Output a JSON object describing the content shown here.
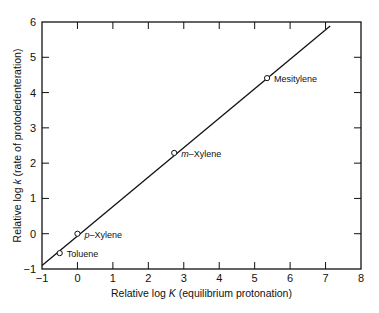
{
  "chart_data": {
    "type": "scatter",
    "title": "",
    "xlabel": "Relative log K (equilibrium protonation)",
    "xlabel_parts": [
      "Relative log ",
      "K",
      " (equilibrium protonation)"
    ],
    "ylabel": "Relative log k (rate of protodedenteration)",
    "ylabel_parts": [
      "Relative log ",
      "k",
      " (rate of protodedenteration)"
    ],
    "xlim": [
      -1,
      8
    ],
    "ylim": [
      -1,
      6
    ],
    "xticks": [
      -1,
      0,
      1,
      2,
      3,
      4,
      5,
      6,
      7,
      8
    ],
    "yticks": [
      -1,
      0,
      1,
      2,
      3,
      4,
      5,
      6
    ],
    "grid": false,
    "legend": null,
    "points": [
      {
        "label": "Toluene",
        "x": -0.5,
        "y": -0.55
      },
      {
        "label": "p-Xylene",
        "label_prefix": "p",
        "label_rest": "–Xylene",
        "x": 0.0,
        "y": 0.0
      },
      {
        "label": "m-Xylene",
        "label_prefix": "m",
        "label_rest": "–Xylene",
        "x": 2.73,
        "y": 2.29
      },
      {
        "label": "Mesitylene",
        "x": 5.35,
        "y": 4.41
      }
    ],
    "fit_line": {
      "x": [
        -1.0,
        7.13
      ],
      "y": [
        -0.9,
        5.89
      ]
    }
  },
  "colors": {
    "ink": "#111111",
    "background": "#ffffff"
  }
}
